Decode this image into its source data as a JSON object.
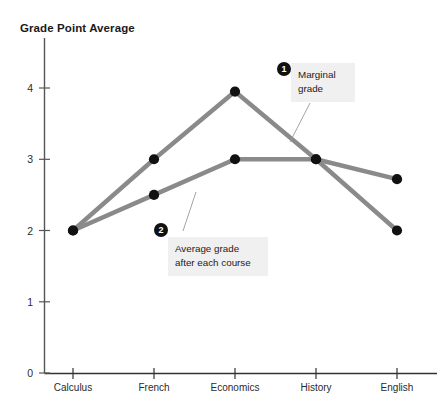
{
  "chart_data": {
    "type": "line",
    "title": "Grade Point Average",
    "xlabel": "",
    "ylabel": "Grade Point Average",
    "categories": [
      "Calculus",
      "French",
      "Economics",
      "History",
      "English"
    ],
    "ylim": [
      0,
      4.4
    ],
    "yticks": [
      "0",
      "1",
      "2",
      "3",
      "4"
    ],
    "ytick_values": [
      0,
      1,
      2,
      3,
      4
    ],
    "grid": false,
    "legend": "none",
    "series": [
      {
        "name": "Marginal grade",
        "values": [
          2.0,
          3.0,
          3.95,
          3.0,
          2.0
        ],
        "color": "#8a8a8a"
      },
      {
        "name": "Average grade after each course",
        "values": [
          2.0,
          2.5,
          3.0,
          3.0,
          2.72
        ],
        "color": "#8a8a8a"
      }
    ],
    "annotations": [
      {
        "badge": "1",
        "text": "Marginal\ngrade",
        "target_series": "Marginal grade"
      },
      {
        "badge": "2",
        "text": "Average grade\nafter each course",
        "target_series": "Average grade after each course"
      }
    ]
  },
  "axis": {
    "y_tick_0": "0",
    "y_tick_1": "1",
    "y_tick_2": "2",
    "y_tick_3": "3",
    "y_tick_4": "4",
    "x_tick_0": "Calculus",
    "x_tick_1": "French",
    "x_tick_2": "Economics",
    "x_tick_3": "History",
    "x_tick_4": "English"
  },
  "annotation_one": {
    "badge": "1",
    "line1": "Marginal",
    "line2": "grade",
    "text": "Marginal\ngrade"
  },
  "annotation_two": {
    "badge": "2",
    "line1": "Average grade",
    "line2": "after each course",
    "text": "Average grade\nafter each course"
  },
  "colors": {
    "line": "#8a8a8a",
    "marker": "#111111",
    "axis": "#555555",
    "callout_bg": "#f0f0f0",
    "text": "#1c1c1c"
  }
}
